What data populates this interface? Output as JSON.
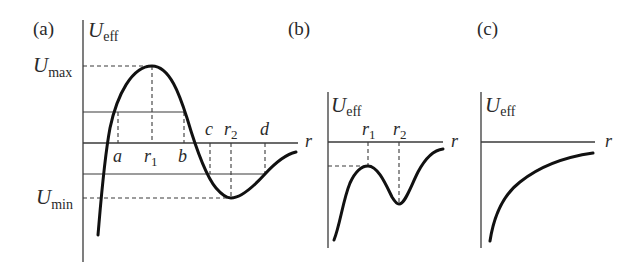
{
  "figure": {
    "panels": [
      {
        "id": "a",
        "label": "(a)",
        "y_axis_label": "U",
        "y_axis_sub": "eff",
        "x_axis_label": "r",
        "level_labels": {
          "max": {
            "main": "U",
            "sub": "max"
          },
          "min": {
            "main": "U",
            "sub": "min"
          }
        },
        "points": [
          {
            "main": "a",
            "sub": ""
          },
          {
            "main": "r",
            "sub": "1"
          },
          {
            "main": "b",
            "sub": ""
          },
          {
            "main": "c",
            "sub": ""
          },
          {
            "main": "r",
            "sub": "2"
          },
          {
            "main": "d",
            "sub": ""
          }
        ],
        "description": "Effective potential with a maximum at r1 (U_max) and a minimum at r2 (U_min); horizontal energy levels intersect the curve at turning points a, b (upper level) and c, d (lower level)."
      },
      {
        "id": "b",
        "label": "(b)",
        "y_axis_label": "U",
        "y_axis_sub": "eff",
        "x_axis_label": "r",
        "points": [
          {
            "main": "r",
            "sub": "1"
          },
          {
            "main": "r",
            "sub": "2"
          }
        ],
        "description": "Effective potential entirely below zero with local maximum at r1 and local minimum at r2."
      },
      {
        "id": "c",
        "label": "(c)",
        "y_axis_label": "U",
        "y_axis_sub": "eff",
        "x_axis_label": "r",
        "description": "Monotonically increasing negative effective potential approaching zero from below."
      }
    ]
  }
}
